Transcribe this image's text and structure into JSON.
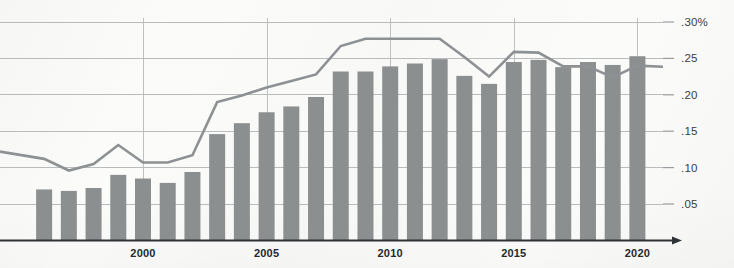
{
  "chart_data": {
    "type": "bar",
    "title": "",
    "subtitle": "",
    "xlabel": "",
    "ylabel": "",
    "grid": true,
    "legend": "none",
    "xlim": [
      1995.5,
      2021.0
    ],
    "ylim": [
      0,
      0.305
    ],
    "y_ticks": [
      0.05,
      0.1,
      0.15,
      0.2,
      0.25,
      0.3
    ],
    "y_tick_labels": [
      ".05",
      ".10",
      ".15",
      ".20",
      ".25",
      ".30%"
    ],
    "x_ticks": [
      2000,
      2005,
      2010,
      2015,
      2020
    ],
    "x_tick_labels": [
      "2000",
      "2005",
      "2010",
      "2015",
      "2020"
    ],
    "categories": [
      "1996",
      "1997",
      "1998",
      "1999",
      "2000",
      "2001",
      "2002",
      "2003",
      "2004",
      "2005",
      "2006",
      "2007",
      "2008",
      "2009",
      "2010",
      "2011",
      "2012",
      "2013",
      "2014",
      "2015",
      "2016",
      "2017",
      "2018",
      "2019",
      "2020"
    ],
    "series": [
      {
        "name": "bars",
        "type": "bar",
        "color": "#8b8f90",
        "values": [
          0.07,
          0.068,
          0.072,
          0.09,
          0.085,
          0.079,
          0.094,
          0.146,
          0.161,
          0.176,
          0.184,
          0.197,
          0.232,
          0.232,
          0.239,
          0.243,
          0.249,
          0.226,
          0.215,
          0.245,
          0.248,
          0.238,
          0.245,
          0.241,
          0.253
        ]
      },
      {
        "name": "trend",
        "type": "line",
        "color": "#8d9193",
        "values": [
          0.112,
          0.096,
          0.105,
          0.131,
          0.107,
          0.107,
          0.117,
          0.19,
          0.199,
          0.21,
          0.219,
          0.228,
          0.267,
          0.277,
          0.277,
          0.277,
          0.277,
          0.252,
          0.225,
          0.259,
          0.258,
          0.239,
          0.239,
          0.224,
          0.24
        ]
      }
    ]
  },
  "axis": {
    "y_unit_suffix": "%",
    "arrow": "right-arrow-icon"
  },
  "colors": {
    "bar": "#8b8f90",
    "line": "#8d9193",
    "grid": "#b9bcbd",
    "axis": "#2f3234",
    "background": "#fbfbfa",
    "tick_text": "#3a3d3f"
  }
}
